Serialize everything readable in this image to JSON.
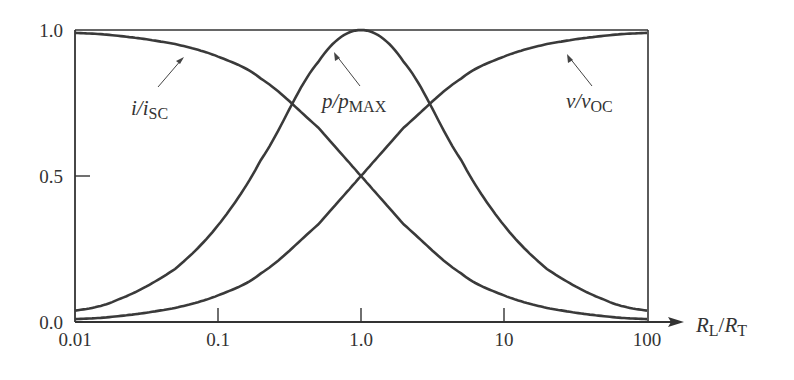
{
  "chart_data": {
    "type": "line",
    "title": "",
    "xlabel": "R_L/R_T",
    "xlabel_parts": {
      "main1": "R",
      "sub1": "L",
      "slash": "/",
      "main2": "R",
      "sub2": "T"
    },
    "ylabel": "",
    "xscale": "log",
    "xlim": [
      0.01,
      100
    ],
    "ylim": [
      0.0,
      1.0
    ],
    "x_ticks": [
      0.01,
      0.1,
      1.0,
      10,
      100
    ],
    "x_tick_labels": [
      "0.01",
      "0.1",
      "1.0",
      "10",
      "100"
    ],
    "y_ticks": [
      0.0,
      0.5,
      1.0
    ],
    "y_tick_labels": [
      "0.0",
      "0.5",
      "1.0"
    ],
    "grid": false,
    "legend": "inline annotations with leader arrows",
    "x": [
      0.01,
      0.02,
      0.05,
      0.1,
      0.2,
      0.5,
      1.0,
      2,
      5,
      10,
      20,
      50,
      100
    ],
    "series": [
      {
        "name": "i/i_SC",
        "label_main": "i/i",
        "label_sub": "SC",
        "formula": "1/(1+R)",
        "values": [
          0.99,
          0.98,
          0.952,
          0.909,
          0.833,
          0.667,
          0.5,
          0.333,
          0.167,
          0.091,
          0.048,
          0.02,
          0.01
        ]
      },
      {
        "name": "p/p_MAX",
        "label_main": "p/p",
        "label_sub": "MAX",
        "formula": "4R/(1+R)^2",
        "values": [
          0.039,
          0.077,
          0.181,
          0.331,
          0.556,
          0.889,
          1.0,
          0.889,
          0.556,
          0.331,
          0.181,
          0.077,
          0.039
        ]
      },
      {
        "name": "v/v_OC",
        "label_main": "v/v",
        "label_sub": "OC",
        "formula": "R/(1+R)",
        "values": [
          0.01,
          0.02,
          0.048,
          0.091,
          0.167,
          0.333,
          0.5,
          0.667,
          0.833,
          0.909,
          0.952,
          0.98,
          0.99
        ]
      }
    ],
    "annotations": [
      {
        "series": "i/i_SC",
        "text": "i/i_SC"
      },
      {
        "series": "p/p_MAX",
        "text": "p/p_MAX"
      },
      {
        "series": "v/v_OC",
        "text": "v/v_OC"
      }
    ]
  }
}
